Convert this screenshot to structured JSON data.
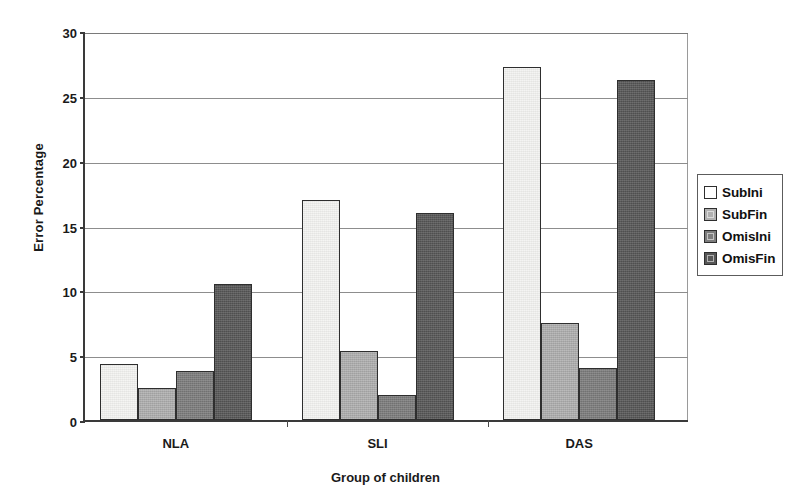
{
  "chart_data": {
    "type": "bar",
    "title": "",
    "xlabel": "Group of children",
    "ylabel": "Error Percentage",
    "categories": [
      "NLA",
      "SLI",
      "DAS"
    ],
    "series": [
      {
        "name": "SubIni",
        "values": [
          4.3,
          17.0,
          27.2
        ],
        "color": "#f4f4f2"
      },
      {
        "name": "SubFin",
        "values": [
          2.5,
          5.3,
          7.5
        ],
        "color": "#b0b0b0"
      },
      {
        "name": "OmisIni",
        "values": [
          3.8,
          1.9,
          4.0
        ],
        "color": "#7d7d7d"
      },
      {
        "name": "OmisFin",
        "values": [
          10.5,
          16.0,
          26.2
        ],
        "color": "#575757"
      }
    ],
    "ylim": [
      0,
      30
    ],
    "yticks": [
      0,
      5,
      10,
      15,
      20,
      25,
      30
    ],
    "ytick_labels": [
      "0",
      "5",
      "10",
      "15",
      "20",
      "25",
      "30"
    ],
    "grid": true,
    "legend_position": "right"
  }
}
